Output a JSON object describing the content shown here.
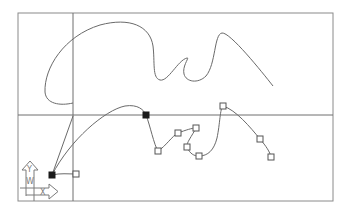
{
  "viewport": {
    "width": 348,
    "height": 211,
    "background": "#ffffff"
  },
  "drawing_area": {
    "frame": {
      "left": 18,
      "top": 13,
      "right": 333,
      "bottom": 201
    },
    "crosshair": {
      "x": 73,
      "y": 115
    }
  },
  "ucs_icon": {
    "y_label": "Y",
    "w_label": "W",
    "x_label": "X"
  },
  "entities": {
    "upper_spline": {
      "type": "spline",
      "selected": false,
      "path": "M73,103 C60,106 46,104 45,92 C44,68 64,36 100,25 C130,17 150,26 153,46 C155,62 152,78 160,80 C168,82 178,60 187,58 C190,57 182,66 184,74 C186,82 198,84 206,76 C216,64 214,34 222,33 C230,32 262,72 273,86"
    },
    "selected_spline": {
      "type": "spline",
      "selected": true,
      "path": "M52,175 C70,140 105,110 125,106 C138,104 144,110 146,115 C150,125 154,145 158,151 C166,146 172,136 178,133 C186,130 192,128 196,128 C192,136 186,143 187,147 C190,154 194,156 199,156 C208,156 214,150 217,138 C220,124 220,108 223,106 C236,110 250,127 260,139 C266,146 270,152 271,157",
      "fit_line": "M52,175 L73,116",
      "tangent_line": "M52,175 C60,173 68,174 76,174"
    }
  },
  "grips": [
    {
      "x": 52,
      "y": 175,
      "state": "hot"
    },
    {
      "x": 76,
      "y": 174,
      "state": "cold"
    },
    {
      "x": 146,
      "y": 115,
      "state": "hot"
    },
    {
      "x": 158,
      "y": 151,
      "state": "cold"
    },
    {
      "x": 178,
      "y": 133,
      "state": "cold"
    },
    {
      "x": 196,
      "y": 128,
      "state": "cold"
    },
    {
      "x": 187,
      "y": 147,
      "state": "cold"
    },
    {
      "x": 199,
      "y": 156,
      "state": "cold"
    },
    {
      "x": 223,
      "y": 106,
      "state": "cold"
    },
    {
      "x": 260,
      "y": 139,
      "state": "cold"
    },
    {
      "x": 271,
      "y": 157,
      "state": "cold"
    }
  ],
  "colors": {
    "frame": "#8a8a8a",
    "crosshair": "#6e6e6e",
    "curve": "#6a6a6a",
    "grip_cold": "#ffffff",
    "grip_hot": "#1a1a1a"
  }
}
